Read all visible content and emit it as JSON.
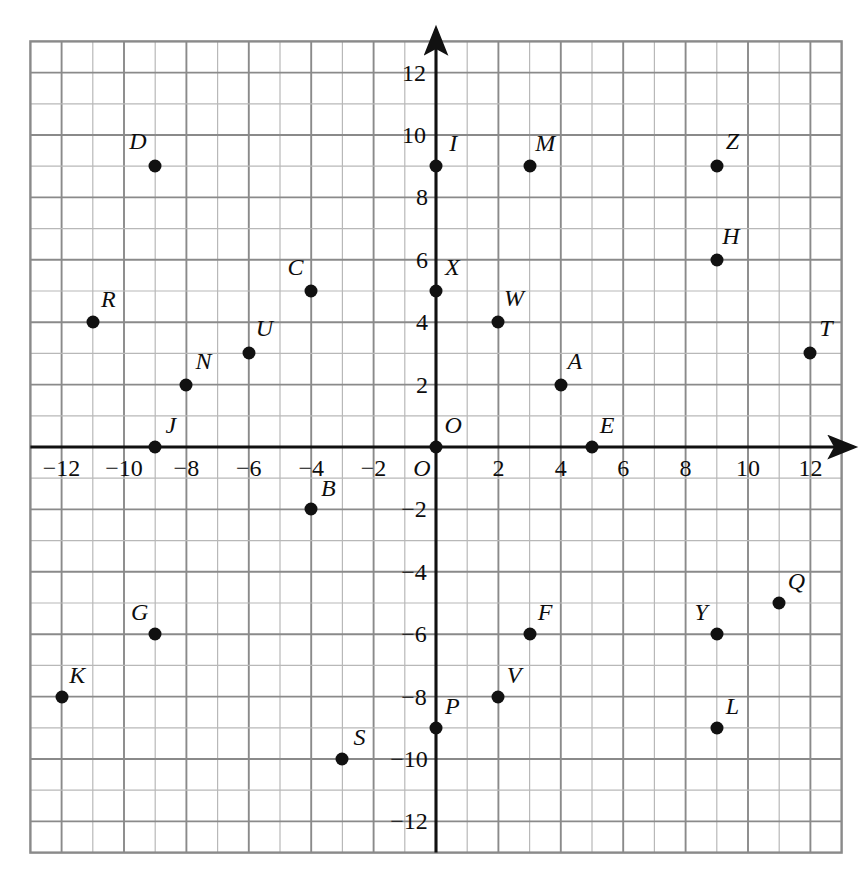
{
  "figure": {
    "kind": "cartesian-coordinate-plane",
    "origin_label": "O",
    "x_axis_label": "",
    "y_axis_label": "",
    "background_color": "#ffffff",
    "grid_color": "#8a8a8a",
    "grid_minor_color": "#b8b8b8",
    "axis_color": "#111111",
    "point_color": "#111111"
  },
  "chart_data": {
    "type": "scatter",
    "title": "",
    "xlabel": "",
    "ylabel": "",
    "xlim": [
      -13,
      13
    ],
    "ylim": [
      -13,
      13
    ],
    "grid": true,
    "legend": "none",
    "x_ticks": [
      -12,
      -10,
      -8,
      -6,
      -4,
      -2,
      2,
      4,
      6,
      8,
      10,
      12
    ],
    "x_tick_labels": [
      "-12",
      "-10",
      "-8",
      "-6",
      "-4",
      "-2",
      "2",
      "4",
      "6",
      "8",
      "10",
      "12"
    ],
    "y_ticks": [
      12,
      10,
      8,
      6,
      4,
      2,
      -2,
      -4,
      -6,
      -8,
      -10,
      -12
    ],
    "y_tick_labels": [
      "12",
      "10",
      "8",
      "6",
      "4",
      "2",
      "-2",
      "-4",
      "-6",
      "-8",
      "-10",
      "-12"
    ],
    "point_labels": [
      "A",
      "B",
      "C",
      "D",
      "E",
      "F",
      "G",
      "H",
      "I",
      "J",
      "K",
      "L",
      "M",
      "N",
      "O",
      "P",
      "Q",
      "R",
      "S",
      "T",
      "U",
      "V",
      "W",
      "X",
      "Y",
      "Z"
    ],
    "points": [
      {
        "label": "A",
        "x": 4,
        "y": 2,
        "lx": 4.45,
        "ly": 2.75
      },
      {
        "label": "B",
        "x": -4,
        "y": -2,
        "lx": -3.45,
        "ly": -1.3
      },
      {
        "label": "C",
        "x": -4,
        "y": 5,
        "lx": -4.5,
        "ly": 5.78
      },
      {
        "label": "D",
        "x": -9,
        "y": 9,
        "lx": -9.55,
        "ly": 9.8
      },
      {
        "label": "E",
        "x": 5,
        "y": 0,
        "lx": 5.48,
        "ly": 0.72
      },
      {
        "label": "F",
        "x": 3,
        "y": -6,
        "lx": 3.5,
        "ly": -5.3
      },
      {
        "label": "G",
        "x": -9,
        "y": -6,
        "lx": -9.5,
        "ly": -5.3
      },
      {
        "label": "H",
        "x": 9,
        "y": 6,
        "lx": 9.45,
        "ly": 6.75
      },
      {
        "label": "I",
        "x": 0,
        "y": 9,
        "lx": 0.55,
        "ly": 9.75
      },
      {
        "label": "J",
        "x": -9,
        "y": 0,
        "lx": -8.5,
        "ly": 0.72
      },
      {
        "label": "K",
        "x": -12,
        "y": -8,
        "lx": -11.5,
        "ly": -7.3
      },
      {
        "label": "L",
        "x": 9,
        "y": -9,
        "lx": 9.5,
        "ly": -8.3
      },
      {
        "label": "M",
        "x": 3,
        "y": 9,
        "lx": 3.5,
        "ly": 9.75
      },
      {
        "label": "N",
        "x": -8,
        "y": 2,
        "lx": -7.45,
        "ly": 2.75
      },
      {
        "label": "O",
        "x": 0,
        "y": 0,
        "lx": 0.55,
        "ly": 0.72
      },
      {
        "label": "P",
        "x": 0,
        "y": -9,
        "lx": 0.52,
        "ly": -8.3
      },
      {
        "label": "Q",
        "x": 11,
        "y": -5,
        "lx": 11.55,
        "ly": -4.3
      },
      {
        "label": "R",
        "x": -11,
        "y": 4,
        "lx": -10.5,
        "ly": 4.75
      },
      {
        "label": "S",
        "x": -3,
        "y": -10,
        "lx": -2.45,
        "ly": -9.3
      },
      {
        "label": "T",
        "x": 12,
        "y": 3,
        "lx": 12.5,
        "ly": 3.8
      },
      {
        "label": "U",
        "x": -6,
        "y": 3,
        "lx": -5.5,
        "ly": 3.8
      },
      {
        "label": "V",
        "x": 2,
        "y": -8,
        "lx": 2.5,
        "ly": -7.3
      },
      {
        "label": "W",
        "x": 2,
        "y": 4,
        "lx": 2.5,
        "ly": 4.78
      },
      {
        "label": "X",
        "x": 0,
        "y": 5,
        "lx": 0.52,
        "ly": 5.78
      },
      {
        "label": "Y",
        "x": 9,
        "y": -6,
        "lx": 8.5,
        "ly": -5.3
      },
      {
        "label": "Z",
        "x": 9,
        "y": 9,
        "lx": 9.5,
        "ly": 9.8
      }
    ]
  }
}
